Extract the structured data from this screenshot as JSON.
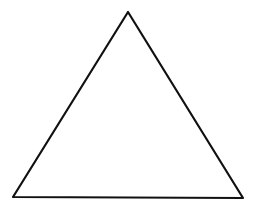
{
  "diagram": {
    "shape": "triangle",
    "background": "#ffffff",
    "stroke": "#111111",
    "stroke_width": 2.2,
    "fill": "none",
    "vertices": {
      "top": {
        "x": 128,
        "y": 12
      },
      "left": {
        "x": 13,
        "y": 197
      },
      "right": {
        "x": 243,
        "y": 198
      }
    }
  }
}
